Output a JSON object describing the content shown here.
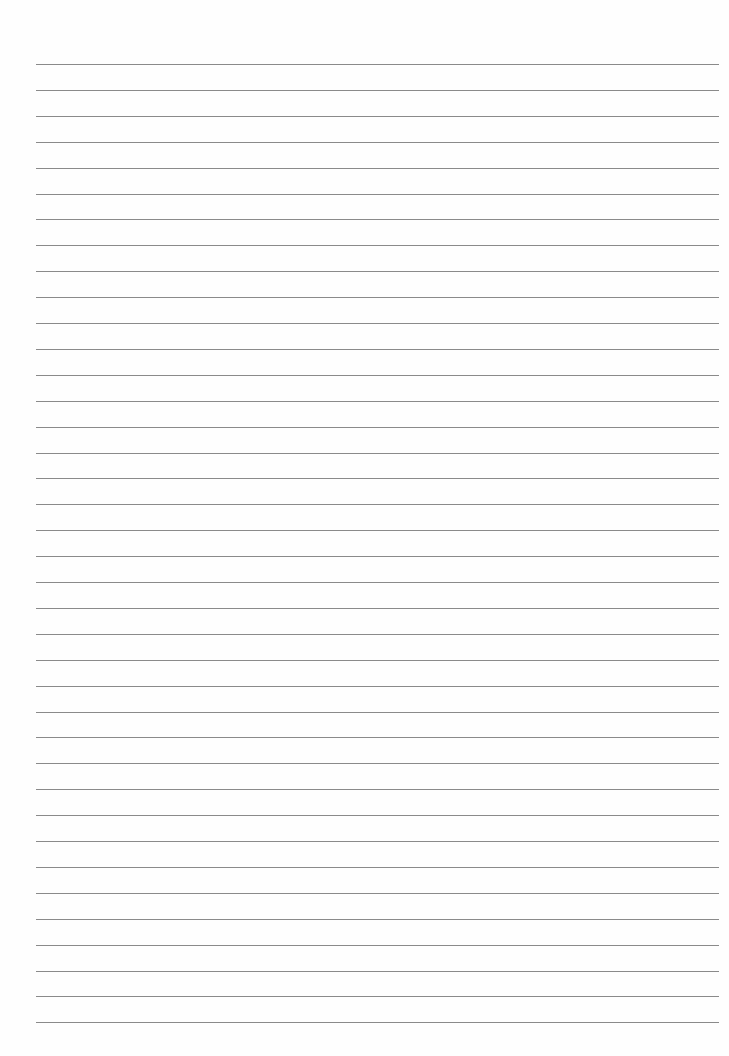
{
  "page": {
    "type": "lined-paper",
    "line_count": 38,
    "first_line_y": 64,
    "line_spacing": 25.9,
    "line_left": 36,
    "line_right": 719,
    "line_color": "#8a8a8a",
    "background": "#fefefe"
  }
}
